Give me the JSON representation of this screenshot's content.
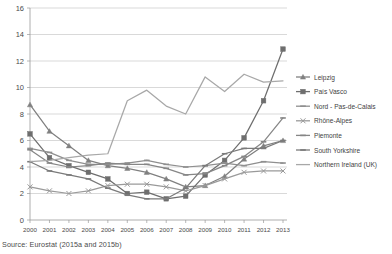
{
  "source": {
    "note": "Source: Eurostat (2015a and 2015b)"
  },
  "legend": {
    "position": "right",
    "items": [
      {
        "label": "Leipzig",
        "color": "#808080",
        "marker": "triangle"
      },
      {
        "label": "País Vasco",
        "color": "#6e6e6e",
        "marker": "square"
      },
      {
        "label": "Nord - Pas-de-Calais",
        "color": "#8f8f8f",
        "marker": "dash"
      },
      {
        "label": "Rhône-Alpes",
        "color": "#9a9a9a",
        "marker": "cross"
      },
      {
        "label": "Piemonte",
        "color": "#868686",
        "marker": "dash"
      },
      {
        "label": "South Yorkshire",
        "color": "#7a7a7a",
        "marker": "dash"
      },
      {
        "label": "Northern Ireland (UK)",
        "color": "#a8a8a8",
        "marker": "none"
      }
    ]
  },
  "chart_data": {
    "type": "line",
    "title": "",
    "xlabel": "",
    "ylabel": "",
    "grid": true,
    "legend_position": "right",
    "categories": [
      "2000",
      "2001",
      "2002",
      "2003",
      "2004",
      "2005",
      "2006",
      "2007",
      "2008",
      "2009",
      "2010",
      "2011",
      "2012",
      "2013"
    ],
    "ylim": [
      0,
      16
    ],
    "yticks": [
      0,
      2,
      4,
      6,
      8,
      10,
      12,
      14,
      16
    ],
    "series": [
      {
        "name": "Leipzig",
        "color": "#808080",
        "marker": "triangle",
        "values": [
          8.7,
          6.7,
          5.6,
          4.5,
          4.1,
          3.9,
          3.6,
          3.1,
          2.5,
          2.6,
          3.3,
          4.6,
          5.6,
          6.0
        ]
      },
      {
        "name": "País Vasco",
        "color": "#6e6e6e",
        "marker": "square",
        "values": [
          6.5,
          4.7,
          4.1,
          3.6,
          3.1,
          2.0,
          2.1,
          1.6,
          1.8,
          3.4,
          4.5,
          6.2,
          9.0,
          12.9
        ]
      },
      {
        "name": "Nord - Pas-de-Calais",
        "color": "#8f8f8f",
        "marker": "dash",
        "values": [
          5.4,
          5.1,
          4.5,
          4.2,
          4.2,
          4.3,
          4.5,
          4.2,
          4.0,
          4.1,
          4.3,
          4.1,
          4.4,
          4.3
        ]
      },
      {
        "name": "Rhône-Alpes",
        "color": "#9a9a9a",
        "marker": "cross",
        "values": [
          2.5,
          2.2,
          2.0,
          2.2,
          2.6,
          2.7,
          2.7,
          2.5,
          2.2,
          2.6,
          3.1,
          3.6,
          3.7,
          3.7
        ]
      },
      {
        "name": "Piemonte",
        "color": "#868686",
        "marker": "dash",
        "values": [
          5.3,
          4.3,
          4.0,
          4.1,
          4.3,
          4.2,
          4.2,
          3.9,
          3.4,
          3.5,
          4.1,
          4.8,
          5.9,
          7.7
        ]
      },
      {
        "name": "South Yorkshire",
        "color": "#7a7a7a",
        "marker": "dash",
        "values": [
          4.4,
          3.7,
          3.4,
          3.1,
          2.4,
          1.9,
          1.6,
          1.6,
          2.4,
          4.1,
          5.0,
          5.4,
          5.4,
          6.0
        ]
      },
      {
        "name": "Northern Ireland (UK)",
        "color": "#a8a8a8",
        "marker": "none",
        "values": [
          4.4,
          4.5,
          4.7,
          4.9,
          5.0,
          9.0,
          9.8,
          8.6,
          8.0,
          10.8,
          9.7,
          11.0,
          10.4,
          10.5
        ]
      }
    ]
  }
}
